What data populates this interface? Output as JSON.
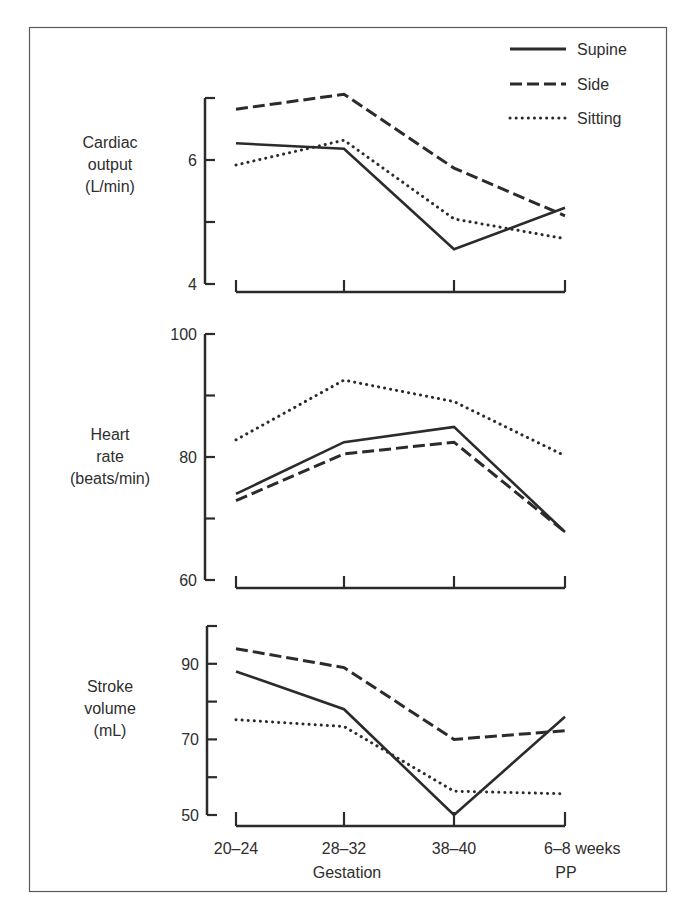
{
  "chart_data": [
    {
      "type": "line",
      "title": "",
      "ylabel": "Cardiac output (L/min)",
      "ylabel_lines": [
        "Cardiac",
        "output",
        "(L/min)"
      ],
      "xlabel": "",
      "categories": [
        "20–24",
        "28–32",
        "38–40",
        "6–8 weeks PP"
      ],
      "ylim": [
        4,
        7
      ],
      "yticks": [
        4,
        5,
        6,
        7
      ],
      "ytick_labels": [
        "4",
        "",
        "6",
        ""
      ],
      "grid": false,
      "series": [
        {
          "name": "Supine",
          "style": "solid",
          "values": [
            6.27,
            6.18,
            4.56,
            5.23
          ]
        },
        {
          "name": "Side",
          "style": "dashed",
          "values": [
            6.82,
            7.06,
            5.87,
            5.1
          ]
        },
        {
          "name": "Sitting",
          "style": "dotted",
          "values": [
            5.92,
            6.32,
            5.05,
            4.73
          ]
        }
      ]
    },
    {
      "type": "line",
      "title": "",
      "ylabel": "Heart rate (beats/min)",
      "ylabel_lines": [
        "Heart",
        "rate",
        "(beats/min)"
      ],
      "xlabel": "",
      "categories": [
        "20–24",
        "28–32",
        "38–40",
        "6–8 weeks PP"
      ],
      "ylim": [
        60,
        100
      ],
      "yticks": [
        60,
        70,
        80,
        90,
        100
      ],
      "ytick_labels": [
        "60",
        "",
        "80",
        "",
        "100"
      ],
      "grid": false,
      "series": [
        {
          "name": "Supine",
          "style": "solid",
          "values": [
            74,
            82.4,
            84.9,
            67.8
          ]
        },
        {
          "name": "Side",
          "style": "dashed",
          "values": [
            72.9,
            80.5,
            82.4,
            67.8
          ]
        },
        {
          "name": "Sitting",
          "style": "dotted",
          "values": [
            82.8,
            92.5,
            89,
            80.2
          ]
        }
      ]
    },
    {
      "type": "line",
      "title": "",
      "ylabel": "Stroke volume (mL)",
      "ylabel_lines": [
        "Stroke",
        "volume",
        "(mL)"
      ],
      "xlabel": "Gestation",
      "categories": [
        "20–24",
        "28–32",
        "38–40",
        "6–8 weeks PP"
      ],
      "ylim": [
        50,
        100
      ],
      "yticks": [
        50,
        60,
        70,
        80,
        90,
        100
      ],
      "ytick_labels": [
        "50",
        "",
        "70",
        "",
        "90",
        ""
      ],
      "grid": false,
      "series": [
        {
          "name": "Supine",
          "style": "solid",
          "values": [
            88,
            78,
            50,
            76
          ]
        },
        {
          "name": "Side",
          "style": "dashed",
          "values": [
            94,
            89,
            70,
            72.3
          ]
        },
        {
          "name": "Sitting",
          "style": "dotted",
          "values": [
            75.2,
            73.4,
            56.3,
            55.6
          ]
        }
      ]
    }
  ],
  "legend": {
    "position": "top-right",
    "entries": [
      {
        "label": "Supine",
        "style": "solid"
      },
      {
        "label": "Side",
        "style": "dashed"
      },
      {
        "label": "Sitting",
        "style": "dotted"
      }
    ]
  },
  "x_axis": {
    "tick_labels": [
      "20–24",
      "28–32",
      "38–40",
      "6–8 weeks"
    ],
    "sublabel_gestation": "Gestation",
    "sublabel_pp": "PP"
  },
  "colors": {
    "line": "#2b2b2b",
    "text": "#2e2e2e",
    "border": "#5a5a5a",
    "background": "#ffffff"
  }
}
